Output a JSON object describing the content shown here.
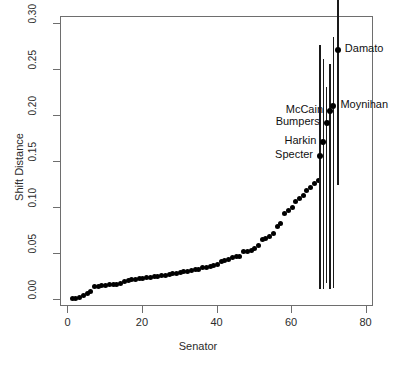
{
  "chart_data": {
    "type": "scatter",
    "title": "",
    "xlabel": "Senator",
    "ylabel": "Shift Distance",
    "xlim": [
      -2,
      82
    ],
    "ylim": [
      -0.008,
      0.308
    ],
    "grid": false,
    "legend": null,
    "x_ticks": [
      0,
      20,
      40,
      60,
      80
    ],
    "x_tick_labels": [
      "0",
      "20",
      "40",
      "60",
      "80"
    ],
    "y_ticks": [
      0.0,
      0.05,
      0.1,
      0.15,
      0.2,
      0.25,
      0.3
    ],
    "y_tick_labels": [
      "0.00",
      "0.05",
      "0.10",
      "0.15",
      "0.20",
      "0.25",
      "0.30"
    ],
    "series": [
      {
        "name": "Senators (unlabeled)",
        "marker": "filled-circle",
        "color": "#000000",
        "points": [
          {
            "x": 1,
            "y": 0.001
          },
          {
            "x": 2,
            "y": 0.0015
          },
          {
            "x": 3,
            "y": 0.002
          },
          {
            "x": 4,
            "y": 0.0045
          },
          {
            "x": 5,
            "y": 0.007
          },
          {
            "x": 6,
            "y": 0.0085
          },
          {
            "x": 7,
            "y": 0.014
          },
          {
            "x": 8,
            "y": 0.0145
          },
          {
            "x": 9,
            "y": 0.015
          },
          {
            "x": 10,
            "y": 0.0155
          },
          {
            "x": 11,
            "y": 0.016
          },
          {
            "x": 12,
            "y": 0.0165
          },
          {
            "x": 13,
            "y": 0.017
          },
          {
            "x": 14,
            "y": 0.0175
          },
          {
            "x": 15,
            "y": 0.0195
          },
          {
            "x": 16,
            "y": 0.021
          },
          {
            "x": 17,
            "y": 0.0215
          },
          {
            "x": 18,
            "y": 0.0225
          },
          {
            "x": 19,
            "y": 0.023
          },
          {
            "x": 20,
            "y": 0.0235
          },
          {
            "x": 21,
            "y": 0.024
          },
          {
            "x": 22,
            "y": 0.0245
          },
          {
            "x": 23,
            "y": 0.025
          },
          {
            "x": 24,
            "y": 0.0255
          },
          {
            "x": 25,
            "y": 0.026
          },
          {
            "x": 26,
            "y": 0.0265
          },
          {
            "x": 27,
            "y": 0.027
          },
          {
            "x": 28,
            "y": 0.0285
          },
          {
            "x": 29,
            "y": 0.029
          },
          {
            "x": 30,
            "y": 0.0295
          },
          {
            "x": 31,
            "y": 0.0305
          },
          {
            "x": 32,
            "y": 0.031
          },
          {
            "x": 33,
            "y": 0.0315
          },
          {
            "x": 34,
            "y": 0.0325
          },
          {
            "x": 35,
            "y": 0.033
          },
          {
            "x": 36,
            "y": 0.0345
          },
          {
            "x": 37,
            "y": 0.0355
          },
          {
            "x": 38,
            "y": 0.0365
          },
          {
            "x": 39,
            "y": 0.0375
          },
          {
            "x": 40,
            "y": 0.0385
          },
          {
            "x": 41,
            "y": 0.0415
          },
          {
            "x": 42,
            "y": 0.0425
          },
          {
            "x": 43,
            "y": 0.0435
          },
          {
            "x": 44,
            "y": 0.0455
          },
          {
            "x": 45,
            "y": 0.0465
          },
          {
            "x": 46,
            "y": 0.0475
          },
          {
            "x": 47,
            "y": 0.052
          },
          {
            "x": 48,
            "y": 0.053
          },
          {
            "x": 49,
            "y": 0.054
          },
          {
            "x": 50,
            "y": 0.0555
          },
          {
            "x": 51,
            "y": 0.0585
          },
          {
            "x": 52,
            "y": 0.0655
          },
          {
            "x": 53,
            "y": 0.0665
          },
          {
            "x": 54,
            "y": 0.0685
          },
          {
            "x": 55,
            "y": 0.0725
          },
          {
            "x": 56,
            "y": 0.0795
          },
          {
            "x": 57,
            "y": 0.0835
          },
          {
            "x": 58,
            "y": 0.0935
          },
          {
            "x": 59,
            "y": 0.0975
          },
          {
            "x": 60,
            "y": 0.1005
          },
          {
            "x": 61,
            "y": 0.1065
          },
          {
            "x": 62,
            "y": 0.1105
          },
          {
            "x": 63,
            "y": 0.1135
          },
          {
            "x": 64,
            "y": 0.1185
          },
          {
            "x": 65,
            "y": 0.122
          },
          {
            "x": 66,
            "y": 0.1265
          },
          {
            "x": 67,
            "y": 0.1295
          }
        ]
      },
      {
        "name": "Labeled senators with confidence intervals",
        "marker": "filled-circle",
        "color": "#000000",
        "points": [
          {
            "x": 67.5,
            "y": 0.157,
            "label": "Specter",
            "label_side": "left",
            "ci_low": 0.012,
            "ci_high": 0.278
          },
          {
            "x": 68.4,
            "y": 0.172,
            "label": "Harkin",
            "label_side": "left",
            "ci_low": 0.012,
            "ci_high": 0.262
          },
          {
            "x": 69.3,
            "y": 0.193,
            "label": "Bumpers",
            "label_side": "left",
            "ci_low": 0.018,
            "ci_high": 0.232
          },
          {
            "x": 70.2,
            "y": 0.206,
            "label": "McCain",
            "label_side": "left",
            "ci_low": 0.012,
            "ci_high": 0.257
          },
          {
            "x": 71.1,
            "y": 0.211,
            "label": "Moynihan",
            "label_side": "right",
            "ci_low": 0.013,
            "ci_high": 0.286
          },
          {
            "x": 72.3,
            "y": 0.272,
            "label": "Damato",
            "label_side": "right",
            "ci_low": 0.125,
            "ci_high": 0.352
          }
        ]
      }
    ],
    "annotations": [
      {
        "text": "Damato",
        "x": 72.3,
        "y": 0.272
      },
      {
        "text": "Moynihan",
        "x": 71.1,
        "y": 0.211
      },
      {
        "text": "McCain",
        "x": 70.2,
        "y": 0.206
      },
      {
        "text": "Bumpers",
        "x": 69.3,
        "y": 0.193
      },
      {
        "text": "Harkin",
        "x": 68.4,
        "y": 0.172
      },
      {
        "text": "Specter",
        "x": 67.5,
        "y": 0.157
      }
    ],
    "colors": {
      "marker": "#000000",
      "errorbar": "#1a1a1a",
      "axis": "#6e6e6e",
      "text": "#2b2b2b",
      "background": "#ffffff"
    }
  }
}
